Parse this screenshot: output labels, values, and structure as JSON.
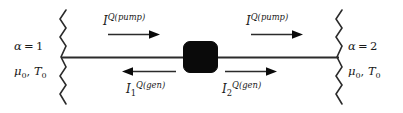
{
  "figure": {
    "width": 403,
    "height": 113,
    "background_color": "#ffffff",
    "ink_color": "#1a1a1a",
    "device_color": "#000000",
    "type": "physics-schematic"
  },
  "reservoirs": {
    "left": {
      "index_label_symbol": "α",
      "index_label_equals": "=",
      "index_label_value": "1",
      "chemical_potential_symbol": "μ",
      "chemical_potential_subscript": "0",
      "separator": ",",
      "temperature_symbol": "T",
      "temperature_subscript": "0"
    },
    "right": {
      "index_label_symbol": "α",
      "index_label_equals": "=",
      "index_label_value": "2",
      "chemical_potential_symbol": "μ",
      "chemical_potential_subscript": "0",
      "separator": ",",
      "temperature_symbol": "T",
      "temperature_subscript": "0"
    }
  },
  "currents": {
    "pump_left": {
      "symbol": "I",
      "superscript": "Q(pump)",
      "subscript": "",
      "direction": "right"
    },
    "pump_right": {
      "symbol": "I",
      "superscript": "Q(pump)",
      "subscript": "",
      "direction": "right"
    },
    "gen_left": {
      "symbol": "I",
      "superscript": "Q(gen)",
      "subscript": "1",
      "direction": "left"
    },
    "gen_right": {
      "symbol": "I",
      "superscript": "Q(gen)",
      "subscript": "2",
      "direction": "right"
    }
  }
}
